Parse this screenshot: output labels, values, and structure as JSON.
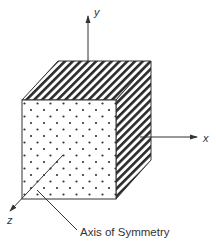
{
  "diagram": {
    "type": "3d-block-with-axes",
    "axes": {
      "x_label": "x",
      "y_label": "y",
      "z_label": "z"
    },
    "callout": {
      "label": "Axis of Symmetry"
    },
    "faces": {
      "front": "dotted",
      "top": "hatched",
      "side": "hatched"
    },
    "colors": {
      "line": "#333333",
      "fill": "#ffffff"
    }
  }
}
